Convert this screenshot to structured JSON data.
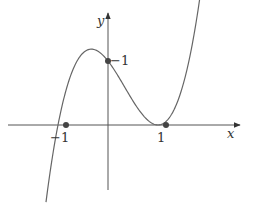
{
  "chart_data": {
    "type": "line",
    "title": "",
    "xlabel": "x",
    "ylabel": "y",
    "function": "y = (x+1)(x-1)^2",
    "grid": false,
    "legend": null,
    "xlim": [
      -2.0,
      2.6
    ],
    "ylim": [
      -1.05,
      1.7
    ],
    "marked_points": [
      {
        "x": -1,
        "y": 0,
        "label": "−1"
      },
      {
        "x": 0,
        "y": 1,
        "label": "−1"
      },
      {
        "x": 1,
        "y": 0,
        "label": "1"
      }
    ],
    "series": [
      {
        "name": "curve",
        "x_range": [
          -1.24,
          1.96
        ]
      }
    ]
  },
  "labels": {
    "x_axis": "x",
    "y_axis": "y",
    "tick_neg1": "−1",
    "tick_pos1": "1",
    "y_intercept": "−1"
  },
  "colors": {
    "axis": "#555555",
    "curve": "#666666",
    "point": "#444444"
  }
}
